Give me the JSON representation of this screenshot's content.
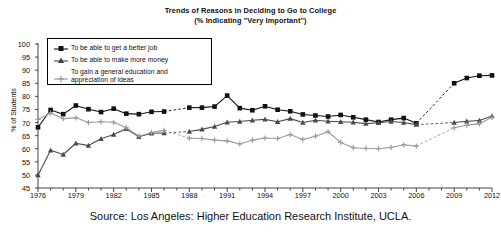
{
  "chart_data": {
    "type": "line",
    "title": "Trends of Reasons in Deciding to Go to College",
    "subtitle": "(% Indicating \"Very Important\")",
    "xlabel": "",
    "ylabel": "% of Students",
    "ylim": [
      45,
      100
    ],
    "ytick_values": [
      45,
      50,
      55,
      60,
      65,
      70,
      75,
      80,
      85,
      90,
      95,
      100
    ],
    "xlim": [
      1976,
      2012
    ],
    "xtick_values": [
      1976,
      1979,
      1982,
      1985,
      1988,
      1991,
      1994,
      1997,
      2000,
      2003,
      2006,
      2009,
      2012
    ],
    "xtick_labels": [
      "1976",
      "1979",
      "1982",
      "1985",
      "1988",
      "1991",
      "1994",
      "1997",
      "2000",
      "2003",
      "2006",
      "2009",
      "2012"
    ],
    "grid": false,
    "legend_position": "upper-left",
    "source": "Source: Los Angeles: Higher Education Research Institute, UCLA.",
    "x": [
      1976,
      1977,
      1978,
      1979,
      1980,
      1981,
      1982,
      1983,
      1984,
      1985,
      1986,
      1988,
      1989,
      1990,
      1991,
      1992,
      1993,
      1994,
      1995,
      1996,
      1997,
      1998,
      1999,
      2000,
      2001,
      2002,
      2003,
      2004,
      2005,
      2006,
      2009,
      2010,
      2011,
      2012
    ],
    "series": [
      {
        "name": "To be able to get a better job",
        "marker": "square",
        "color": "#111111",
        "values": [
          68.2,
          74.8,
          73.2,
          76.5,
          75.1,
          74.0,
          75.3,
          73.4,
          73.2,
          74.1,
          74.2,
          75.7,
          75.7,
          76.1,
          80.3,
          75.5,
          74.7,
          76.2,
          74.9,
          74.3,
          73.1,
          72.7,
          72.3,
          72.9,
          72.0,
          71.1,
          70.2,
          71.1,
          71.7,
          69.7,
          85.0,
          87.0,
          87.9,
          88.0
        ]
      },
      {
        "name": "To be able to make more money",
        "marker": "triangle",
        "color": "#4a4a4a",
        "values": [
          49.9,
          59.4,
          57.8,
          62.1,
          61.2,
          63.8,
          65.4,
          67.6,
          64.6,
          65.9,
          66.0,
          66.6,
          67.4,
          68.5,
          70.1,
          70.4,
          70.9,
          71.2,
          70.3,
          71.5,
          70.0,
          70.9,
          70.5,
          70.3,
          70.1,
          69.6,
          69.9,
          70.4,
          70.0,
          69.2,
          70.0,
          70.5,
          70.8,
          72.5
        ]
      },
      {
        "name": "To gain a general education and appreciation of ideas",
        "marker": "plus",
        "color": "#9a9a9a",
        "values": [
          71.2,
          73.6,
          71.5,
          71.8,
          70.0,
          70.3,
          70.1,
          68.0,
          64.8,
          66.2,
          67.0,
          64.0,
          63.9,
          63.3,
          63.0,
          61.8,
          63.3,
          64.1,
          63.9,
          65.4,
          63.5,
          64.8,
          66.5,
          62.4,
          60.4,
          60.1,
          60.0,
          60.5,
          61.5,
          61.0,
          68.0,
          69.0,
          69.5,
          72.0
        ]
      }
    ],
    "gaps": [
      [
        1986,
        1988
      ],
      [
        2006,
        2009
      ]
    ]
  },
  "legend": {
    "items": [
      {
        "label": "To be able to get a better job"
      },
      {
        "label": "To be able to make more money"
      },
      {
        "label_line1": "To gain a general education and",
        "label_line2": "appreciation of ideas"
      }
    ]
  }
}
